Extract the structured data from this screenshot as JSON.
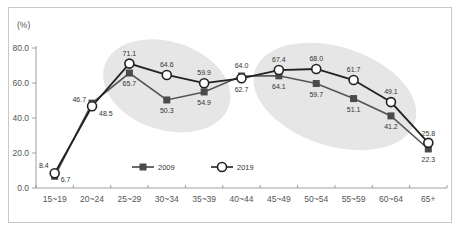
{
  "chart_data": {
    "type": "line",
    "title": "",
    "ylabel": "(%)",
    "xlabel": "",
    "ylim": [
      0,
      80
    ],
    "yticks": [
      "0.0",
      "20.0",
      "40.0",
      "60.0",
      "80.0"
    ],
    "ytick_values": [
      0,
      20,
      40,
      60,
      80
    ],
    "categories": [
      "15~19",
      "20~24",
      "25~29",
      "30~34",
      "35~39",
      "40~44",
      "45~49",
      "50~54",
      "55~59",
      "60~64",
      "65+"
    ],
    "series": [
      {
        "name": "2009",
        "marker": "filled-square",
        "color": "#555555",
        "values": [
          6.7,
          48.5,
          65.7,
          50.3,
          54.9,
          64.0,
          64.1,
          59.7,
          51.1,
          41.2,
          22.3
        ],
        "labels": [
          "6.7",
          "48.5",
          "65.7",
          "50.3",
          "54.9",
          "64.0",
          "64.1",
          "59.7",
          "51.1",
          "41.2",
          "22.3"
        ]
      },
      {
        "name": "2019",
        "marker": "hollow-circle",
        "color": "#222222",
        "values": [
          8.4,
          46.7,
          71.1,
          64.6,
          59.9,
          62.7,
          67.4,
          68.0,
          61.7,
          49.1,
          25.8
        ],
        "labels": [
          "8.4",
          "46.7",
          "71.1",
          "64.6",
          "59.9",
          "62.7",
          "67.4",
          "68.0",
          "61.7",
          "49.1",
          "25.8"
        ]
      }
    ],
    "highlights": [
      {
        "from": "25~29",
        "to": "35~39",
        "shape": "ellipse",
        "color": "#e6e6e6"
      },
      {
        "from": "45~49",
        "to": "60~64",
        "shape": "ellipse",
        "color": "#e6e6e6"
      }
    ],
    "legend": {
      "placement": "bottom-center-inside",
      "entries": [
        "2009",
        "2019"
      ]
    },
    "grid": false
  }
}
